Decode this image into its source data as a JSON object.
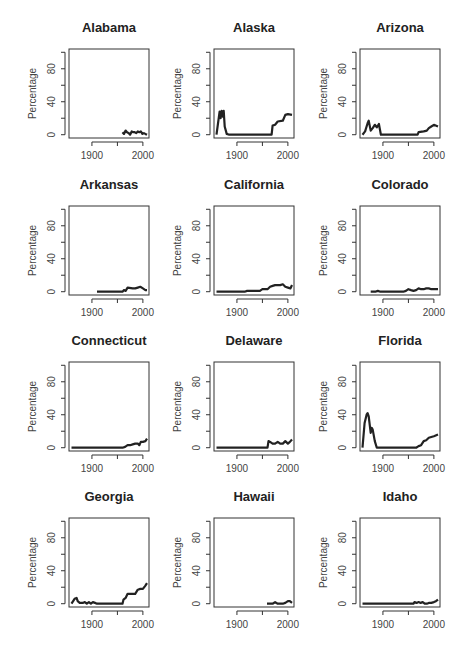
{
  "layout": {
    "rows": 4,
    "cols": 3
  },
  "chart_data": [
    {
      "type": "line",
      "title": "Alabama",
      "xlabel": "",
      "ylabel": "Percentage",
      "xlim": [
        1855,
        2012
      ],
      "ylim": [
        -4,
        104
      ],
      "yticks": [
        0,
        20,
        40,
        60,
        80,
        100
      ],
      "ytick_labels": [
        "0",
        "",
        "40",
        "",
        "80",
        ""
      ],
      "xticks": [
        1900,
        1950,
        2000
      ],
      "xtick_labels": [
        "1900",
        "",
        "2000"
      ],
      "grid": false,
      "x": [
        1960,
        1963,
        1966,
        1969,
        1972,
        1975,
        1978,
        1981,
        1984,
        1987,
        1990,
        1993,
        1996,
        1999,
        2002,
        2005,
        2008
      ],
      "values": [
        3,
        1,
        5,
        3,
        2,
        0,
        4,
        3,
        3,
        2,
        4,
        3,
        4,
        1,
        2,
        1,
        0
      ]
    },
    {
      "type": "line",
      "title": "Alaska",
      "xlabel": "",
      "ylabel": "Percentage",
      "xlim": [
        1855,
        2012
      ],
      "ylim": [
        -4,
        104
      ],
      "yticks": [
        0,
        20,
        40,
        60,
        80,
        100
      ],
      "ytick_labels": [
        "0",
        "",
        "40",
        "",
        "80",
        ""
      ],
      "xticks": [
        1900,
        1950,
        2000
      ],
      "xtick_labels": [
        "1900",
        "",
        "2000"
      ],
      "grid": false,
      "x": [
        1860,
        1866,
        1868,
        1870,
        1872,
        1874,
        1876,
        1880,
        1885,
        1900,
        1950,
        1968,
        1970,
        1975,
        1980,
        1990,
        1995,
        2000,
        2008
      ],
      "values": [
        0,
        28,
        20,
        29,
        22,
        29,
        10,
        1,
        0,
        0,
        0,
        0,
        11,
        12,
        16,
        17,
        24,
        25,
        24
      ]
    },
    {
      "type": "line",
      "title": "Arizona",
      "xlabel": "",
      "ylabel": "Percentage",
      "xlim": [
        1855,
        2012
      ],
      "ylim": [
        -4,
        104
      ],
      "yticks": [
        0,
        20,
        40,
        60,
        80,
        100
      ],
      "ytick_labels": [
        "0",
        "",
        "40",
        "",
        "80",
        ""
      ],
      "xticks": [
        1900,
        1950,
        2000
      ],
      "xtick_labels": [
        "1900",
        "",
        "2000"
      ],
      "grid": false,
      "x": [
        1860,
        1865,
        1870,
        1872,
        1876,
        1880,
        1884,
        1888,
        1892,
        1896,
        1900,
        1950,
        1968,
        1970,
        1980,
        1986,
        1990,
        1995,
        2000,
        2008
      ],
      "values": [
        0,
        4,
        14,
        17,
        5,
        8,
        12,
        9,
        13,
        0,
        0,
        0,
        0,
        3,
        4,
        5,
        8,
        10,
        12,
        10
      ]
    },
    {
      "type": "line",
      "title": "Arkansas",
      "xlabel": "",
      "ylabel": "Percentage",
      "xlim": [
        1855,
        2012
      ],
      "ylim": [
        -4,
        104
      ],
      "yticks": [
        0,
        20,
        40,
        60,
        80,
        100
      ],
      "ytick_labels": [
        "0",
        "",
        "40",
        "",
        "80",
        ""
      ],
      "xticks": [
        1900,
        1950,
        2000
      ],
      "xtick_labels": [
        "1900",
        "",
        "2000"
      ],
      "grid": false,
      "x": [
        1910,
        1930,
        1950,
        1960,
        1963,
        1966,
        1970,
        1980,
        1985,
        1990,
        1995,
        2000,
        2005,
        2008
      ],
      "values": [
        0,
        0,
        0,
        0,
        2,
        1,
        5,
        4,
        4,
        5,
        6,
        4,
        2,
        2
      ]
    },
    {
      "type": "line",
      "title": "California",
      "xlabel": "",
      "ylabel": "Percentage",
      "xlim": [
        1855,
        2012
      ],
      "ylim": [
        -4,
        104
      ],
      "yticks": [
        0,
        20,
        40,
        60,
        80,
        100
      ],
      "ytick_labels": [
        "0",
        "",
        "40",
        "",
        "80",
        ""
      ],
      "xticks": [
        1900,
        1950,
        2000
      ],
      "xtick_labels": [
        "1900",
        "",
        "2000"
      ],
      "grid": false,
      "x": [
        1860,
        1900,
        1915,
        1920,
        1945,
        1950,
        1960,
        1965,
        1970,
        1975,
        1980,
        1985,
        1990,
        1995,
        2000,
        2005,
        2008
      ],
      "values": [
        0,
        0,
        0,
        1,
        1,
        3,
        3,
        6,
        7,
        8,
        8,
        8,
        9,
        6,
        5,
        4,
        8
      ]
    },
    {
      "type": "line",
      "title": "Colorado",
      "xlabel": "",
      "ylabel": "Percentage",
      "xlim": [
        1855,
        2012
      ],
      "ylim": [
        -4,
        104
      ],
      "yticks": [
        0,
        20,
        40,
        60,
        80,
        100
      ],
      "ytick_labels": [
        "0",
        "",
        "40",
        "",
        "80",
        ""
      ],
      "xticks": [
        1900,
        1950,
        2000
      ],
      "xtick_labels": [
        "1900",
        "",
        "2000"
      ],
      "grid": false,
      "x": [
        1876,
        1885,
        1890,
        1895,
        1900,
        1940,
        1945,
        1950,
        1955,
        1960,
        1965,
        1970,
        1975,
        1980,
        1985,
        1990,
        1995,
        2000,
        2008
      ],
      "values": [
        0,
        0,
        1,
        0,
        0,
        0,
        1,
        3,
        2,
        1,
        2,
        4,
        3,
        3,
        4,
        4,
        3,
        3,
        3
      ]
    },
    {
      "type": "line",
      "title": "Connecticut",
      "xlabel": "",
      "ylabel": "Percentage",
      "xlim": [
        1855,
        2012
      ],
      "ylim": [
        -4,
        104
      ],
      "yticks": [
        0,
        20,
        40,
        60,
        80,
        100
      ],
      "ytick_labels": [
        "0",
        "",
        "40",
        "",
        "80",
        ""
      ],
      "xticks": [
        1900,
        1950,
        2000
      ],
      "xtick_labels": [
        "1900",
        "",
        "2000"
      ],
      "grid": false,
      "x": [
        1860,
        1900,
        1950,
        1960,
        1965,
        1970,
        1975,
        1980,
        1985,
        1990,
        1993,
        1996,
        2000,
        2005,
        2008
      ],
      "values": [
        0,
        0,
        0,
        0,
        1,
        3,
        3,
        4,
        5,
        5,
        3,
        7,
        7,
        8,
        11
      ]
    },
    {
      "type": "line",
      "title": "Delaware",
      "xlabel": "",
      "ylabel": "Percentage",
      "xlim": [
        1855,
        2012
      ],
      "ylim": [
        -4,
        104
      ],
      "yticks": [
        0,
        20,
        40,
        60,
        80,
        100
      ],
      "ytick_labels": [
        "0",
        "",
        "40",
        "",
        "80",
        ""
      ],
      "xticks": [
        1900,
        1950,
        2000
      ],
      "xtick_labels": [
        "1900",
        "",
        "2000"
      ],
      "grid": false,
      "x": [
        1860,
        1900,
        1950,
        1960,
        1962,
        1965,
        1970,
        1975,
        1980,
        1985,
        1990,
        1995,
        2000,
        2004,
        2008
      ],
      "values": [
        0,
        0,
        0,
        0,
        8,
        7,
        5,
        5,
        7,
        5,
        5,
        8,
        5,
        7,
        10
      ]
    },
    {
      "type": "line",
      "title": "Florida",
      "xlabel": "",
      "ylabel": "Percentage",
      "xlim": [
        1855,
        2012
      ],
      "ylim": [
        -4,
        104
      ],
      "yticks": [
        0,
        20,
        40,
        60,
        80,
        100
      ],
      "ytick_labels": [
        "0",
        "",
        "40",
        "",
        "80",
        ""
      ],
      "xticks": [
        1900,
        1950,
        2000
      ],
      "xtick_labels": [
        "1900",
        "",
        "2000"
      ],
      "grid": false,
      "x": [
        1860,
        1864,
        1868,
        1870,
        1872,
        1874,
        1876,
        1878,
        1880,
        1884,
        1888,
        1892,
        1900,
        1950,
        1965,
        1970,
        1975,
        1980,
        1985,
        1990,
        1995,
        2000,
        2008
      ],
      "values": [
        0,
        30,
        40,
        42,
        38,
        28,
        18,
        24,
        22,
        8,
        0,
        0,
        0,
        0,
        0,
        2,
        3,
        8,
        9,
        12,
        13,
        14,
        16
      ]
    },
    {
      "type": "line",
      "title": "Georgia",
      "xlabel": "",
      "ylabel": "Percentage",
      "xlim": [
        1855,
        2012
      ],
      "ylim": [
        -4,
        104
      ],
      "yticks": [
        0,
        20,
        40,
        60,
        80,
        100
      ],
      "ytick_labels": [
        "0",
        "",
        "40",
        "",
        "80",
        ""
      ],
      "xticks": [
        1900,
        1950,
        2000
      ],
      "xtick_labels": [
        "1900",
        "",
        "2000"
      ],
      "grid": false,
      "x": [
        1860,
        1866,
        1870,
        1872,
        1876,
        1882,
        1886,
        1890,
        1894,
        1898,
        1902,
        1906,
        1910,
        1960,
        1962,
        1966,
        1970,
        1975,
        1980,
        1985,
        1990,
        1995,
        2000,
        2005,
        2008
      ],
      "values": [
        0,
        6,
        7,
        3,
        1,
        1,
        2,
        0,
        2,
        0,
        2,
        1,
        0,
        0,
        5,
        7,
        12,
        12,
        12,
        12,
        17,
        18,
        18,
        22,
        25
      ]
    },
    {
      "type": "line",
      "title": "Hawaii",
      "xlabel": "",
      "ylabel": "Percentage",
      "xlim": [
        1855,
        2012
      ],
      "ylim": [
        -4,
        104
      ],
      "yticks": [
        0,
        20,
        40,
        60,
        80,
        100
      ],
      "ytick_labels": [
        "0",
        "",
        "40",
        "",
        "80",
        ""
      ],
      "xticks": [
        1900,
        1950,
        2000
      ],
      "xtick_labels": [
        "1900",
        "",
        "2000"
      ],
      "grid": false,
      "x": [
        1959,
        1965,
        1970,
        1975,
        1980,
        1985,
        1990,
        1995,
        2000,
        2004,
        2008
      ],
      "values": [
        0,
        0,
        0,
        2,
        0,
        0,
        0,
        1,
        3,
        3,
        1
      ]
    },
    {
      "type": "line",
      "title": "Idaho",
      "xlabel": "",
      "ylabel": "Percentage",
      "xlim": [
        1855,
        2012
      ],
      "ylim": [
        -4,
        104
      ],
      "yticks": [
        0,
        20,
        40,
        60,
        80,
        100
      ],
      "ytick_labels": [
        "0",
        "",
        "40",
        "",
        "80",
        ""
      ],
      "xticks": [
        1900,
        1950,
        2000
      ],
      "xtick_labels": [
        "1900",
        "",
        "2000"
      ],
      "grid": false,
      "x": [
        1860,
        1900,
        1950,
        1960,
        1962,
        1966,
        1970,
        1974,
        1978,
        1982,
        1986,
        1990,
        1995,
        2000,
        2004,
        2008
      ],
      "values": [
        0,
        0,
        0,
        0,
        2,
        1,
        2,
        1,
        2,
        0,
        0,
        1,
        1,
        2,
        3,
        5
      ]
    }
  ]
}
